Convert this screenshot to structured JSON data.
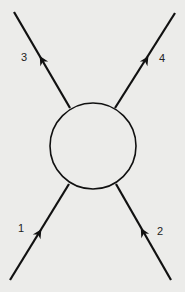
{
  "diagram": {
    "type": "feynman-scattering",
    "blob": {
      "shape": "circle",
      "cx": 93,
      "cy": 146,
      "r": 43
    },
    "legs": [
      {
        "id": "leg-1",
        "label": "1",
        "direction": "incoming",
        "from": [
          10,
          280
        ],
        "to": [
          69,
          184
        ],
        "arrow": [
          39,
          233
        ],
        "label_pos": [
          18,
          232
        ]
      },
      {
        "id": "leg-2",
        "label": "2",
        "direction": "incoming",
        "from": [
          171,
          280
        ],
        "to": [
          116,
          184
        ],
        "arrow": [
          143,
          232
        ],
        "label_pos": [
          157,
          235
        ]
      },
      {
        "id": "leg-3",
        "label": "3",
        "direction": "outgoing",
        "from": [
          70,
          108
        ],
        "to": [
          14,
          12
        ],
        "arrow": [
          42,
          60
        ],
        "label_pos": [
          21,
          61
        ]
      },
      {
        "id": "leg-4",
        "label": "4",
        "direction": "outgoing",
        "from": [
          115,
          108
        ],
        "to": [
          175,
          13
        ],
        "arrow": [
          146,
          60
        ],
        "label_pos": [
          159,
          62
        ]
      }
    ],
    "stroke_color": "#111111",
    "background": "#ececea"
  }
}
